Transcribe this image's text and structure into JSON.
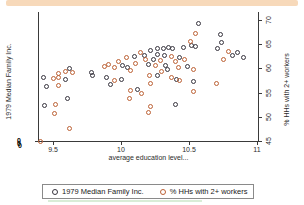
{
  "colors": {
    "top_band": "#f7d9ba",
    "series_income": "#37343e",
    "series_workers": "#bc6135",
    "legend_border": "#8a8a8a",
    "green_bar": "#d9edd7",
    "axis": "#3a3a3a"
  },
  "chart_data": {
    "type": "scatter",
    "title": "",
    "xlabel": "average education level...",
    "ylabel_left": "1979 Median Family Inc.",
    "ylabel_right": "% HHs with 2+ workers",
    "x_ticks": [
      9.5,
      10,
      10.5,
      11
    ],
    "right_y_ticks": [
      45,
      50,
      55,
      60,
      65,
      70
    ],
    "xlim": [
      9.39,
      11.01
    ],
    "right_ylim": [
      45,
      71.6
    ],
    "grid": false,
    "legend_position": "bottom",
    "legend": [
      "1979 Median Family Inc.",
      "% HHs with 2+ workers"
    ],
    "left_axis_overlap_char": "0",
    "y_scale_note": "left-axis tick labels overlap illegibly; both series read on shared plotted scale (right axis 45-70)",
    "series": [
      {
        "name": "1979 Median Family Inc.",
        "marker_color": "#37343e",
        "points": [
          [
            9.62,
            59.9
          ],
          [
            9.78,
            59.1
          ],
          [
            10.01,
            60.6
          ],
          [
            10.05,
            60.2
          ],
          [
            10.1,
            62.5
          ],
          [
            10.17,
            62.7
          ],
          [
            10.57,
            69.2
          ],
          [
            10.46,
            64.4
          ],
          [
            10.52,
            64.8
          ],
          [
            10.55,
            64.5
          ],
          [
            10.74,
            65.3
          ],
          [
            10.71,
            64.1
          ],
          [
            10.82,
            62.7
          ],
          [
            10.86,
            63.2
          ],
          [
            10.9,
            62.3
          ],
          [
            10.22,
            63.7
          ],
          [
            10.27,
            64.1
          ],
          [
            10.31,
            64.2
          ],
          [
            10.38,
            64.1
          ],
          [
            10.32,
            62.7
          ],
          [
            10.24,
            61.8
          ],
          [
            10.2,
            60.8
          ],
          [
            10.33,
            60.6
          ],
          [
            10.43,
            62.2
          ],
          [
            10.34,
            59.7
          ],
          [
            10.49,
            60.4
          ],
          [
            9.43,
            58.1
          ],
          [
            9.45,
            56.2
          ],
          [
            9.79,
            58.5
          ],
          [
            9.44,
            52.4
          ],
          [
            10.73,
            67.1
          ],
          [
            10.35,
            64.4
          ],
          [
            10.27,
            62.8
          ],
          [
            9.59,
            57.8
          ],
          [
            9.89,
            58.1
          ],
          [
            10.0,
            57.8
          ],
          [
            9.92,
            56.6
          ],
          [
            10.12,
            55.7
          ],
          [
            9.61,
            53.7
          ],
          [
            10.27,
            58.6
          ],
          [
            10.41,
            57.8
          ],
          [
            10.53,
            57.3
          ],
          [
            10.4,
            52.6
          ]
        ]
      },
      {
        "name": "% HHs with 2+ workers",
        "marker_color": "#bc6135",
        "points": [
          [
            9.54,
            59.0
          ],
          [
            9.59,
            59.4
          ],
          [
            9.64,
            59.2
          ],
          [
            9.88,
            60.4
          ],
          [
            9.91,
            60.9
          ],
          [
            9.95,
            60.1
          ],
          [
            9.98,
            61.5
          ],
          [
            10.04,
            62.2
          ],
          [
            10.07,
            59.5
          ],
          [
            10.11,
            61.1
          ],
          [
            10.14,
            63.2
          ],
          [
            10.18,
            61.8
          ],
          [
            10.55,
            67.3
          ],
          [
            10.51,
            65.6
          ],
          [
            10.79,
            63.5
          ],
          [
            10.75,
            61.8
          ],
          [
            10.37,
            62.5
          ],
          [
            10.29,
            61.6
          ],
          [
            10.25,
            60.6
          ],
          [
            10.4,
            61.5
          ],
          [
            10.47,
            61.8
          ],
          [
            10.3,
            59.4
          ],
          [
            10.42,
            60.1
          ],
          [
            10.53,
            59.7
          ],
          [
            9.5,
            58.0
          ],
          [
            9.54,
            58.1
          ],
          [
            9.54,
            56.4
          ],
          [
            9.95,
            57.6
          ],
          [
            10.07,
            55.5
          ],
          [
            10.15,
            54.9
          ],
          [
            10.06,
            53.8
          ],
          [
            9.52,
            52.6
          ],
          [
            9.51,
            50.7
          ],
          [
            9.62,
            47.6
          ],
          [
            9.41,
            44.9
          ],
          [
            10.21,
            58.5
          ],
          [
            10.37,
            58.1
          ],
          [
            10.43,
            57.6
          ],
          [
            10.22,
            56.9
          ],
          [
            10.7,
            56.9
          ],
          [
            10.53,
            55.2
          ],
          [
            10.22,
            52.1
          ],
          [
            10.2,
            50.9
          ]
        ]
      }
    ]
  }
}
